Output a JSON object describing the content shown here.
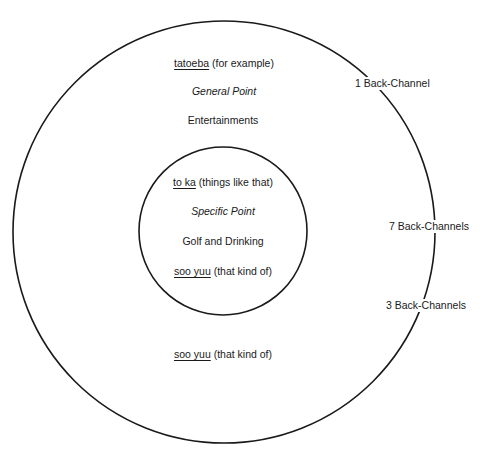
{
  "diagram": {
    "outer_circle": {
      "cx": 224,
      "cy": 232,
      "r": 211,
      "labels": {
        "top_term": "tatoeba",
        "top_gloss": " (for example)",
        "point_type": "General Point",
        "topic": "Entertainments",
        "bottom_term": "soo yuu",
        "bottom_gloss": " (that kind of)"
      }
    },
    "inner_circle": {
      "cx": 223,
      "cy": 231,
      "r": 84,
      "labels": {
        "top_term": "to ka",
        "top_gloss": " (things like that)",
        "point_type": "Specific Point",
        "topic": "Golf and Drinking",
        "bottom_term": "soo yuu",
        "bottom_gloss": " (that kind of)"
      }
    },
    "back_channels": [
      {
        "label": "1 Back-Channel"
      },
      {
        "label": "7 Back-Channels"
      },
      {
        "label": "3 Back-Channels"
      }
    ],
    "stroke_color": "#1a1a1a",
    "background_color": "#ffffff"
  }
}
